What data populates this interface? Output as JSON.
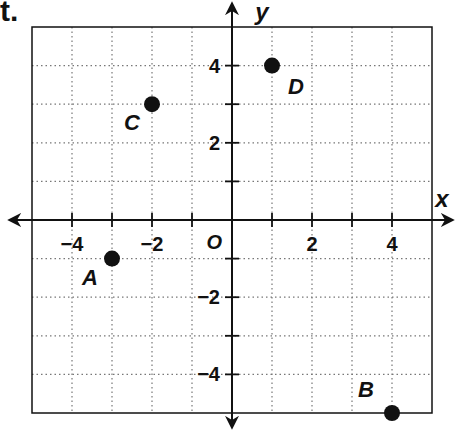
{
  "problem_label": "t.",
  "chart_data": {
    "type": "scatter",
    "title": "",
    "xlabel": "x",
    "ylabel": "y",
    "origin_label": "O",
    "xlim": [
      -5,
      5
    ],
    "ylim": [
      -5,
      5
    ],
    "grid": true,
    "grid_style": "dotted",
    "x_ticks": [
      -4,
      -3,
      -2,
      -1,
      1,
      2,
      3,
      4
    ],
    "y_ticks": [
      -4,
      -3,
      -2,
      -1,
      1,
      2,
      3,
      4
    ],
    "x_tick_labels": [
      {
        "value": -4,
        "text": "−4"
      },
      {
        "value": -2,
        "text": "−2"
      },
      {
        "value": 2,
        "text": "2"
      },
      {
        "value": 4,
        "text": "4"
      }
    ],
    "y_tick_labels": [
      {
        "value": 4,
        "text": "4"
      },
      {
        "value": 2,
        "text": "2"
      },
      {
        "value": -2,
        "text": "−2"
      },
      {
        "value": -4,
        "text": "−4"
      }
    ],
    "points": [
      {
        "label": "A",
        "x": -3,
        "y": -1
      },
      {
        "label": "B",
        "x": 4,
        "y": -5
      },
      {
        "label": "C",
        "x": -2,
        "y": 3
      },
      {
        "label": "D",
        "x": 1,
        "y": 4
      }
    ]
  },
  "colors": {
    "ink": "#111111",
    "grid": "#777777",
    "background": "#ffffff"
  }
}
